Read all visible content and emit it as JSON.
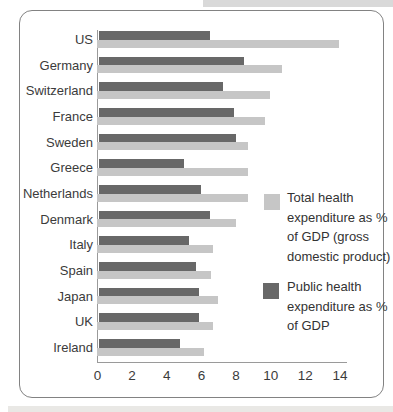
{
  "figure": {
    "border_color": "#828282",
    "background": "#ffffff",
    "axis_color": "#9a9a9a",
    "text_color": "#3b3b3b"
  },
  "chart_data": {
    "type": "bar",
    "orientation": "horizontal",
    "title": "",
    "xlabel": "",
    "ylabel": "",
    "grid": false,
    "legend_position": "right-middle",
    "categories": [
      "US",
      "Germany",
      "Switzerland",
      "France",
      "Sweden",
      "Greece",
      "Netherlands",
      "Denmark",
      "Italy",
      "Spain",
      "Japan",
      "UK",
      "Ireland"
    ],
    "series": [
      {
        "name": "Total health expenditure as % of GDP (gross domestic product)",
        "color": "#c6c6c6",
        "values": [
          14.0,
          10.7,
          10.0,
          9.7,
          8.7,
          8.7,
          8.7,
          8.0,
          6.7,
          6.6,
          7.0,
          6.7,
          6.2
        ]
      },
      {
        "name": "Public health expenditure as % of GDP",
        "color": "#686868",
        "values": [
          6.5,
          8.5,
          7.3,
          7.9,
          8.0,
          5.0,
          6.0,
          6.5,
          5.3,
          5.7,
          5.9,
          5.9,
          4.8
        ]
      }
    ],
    "xticks": [
      0,
      2,
      4,
      6,
      8,
      10,
      12,
      14
    ],
    "xlim": [
      0,
      14.8
    ]
  },
  "legend": {
    "total_label": "Total health expenditure as % of GDP (gross domestic product)",
    "public_label": "Public health expenditure as % of GDP"
  }
}
